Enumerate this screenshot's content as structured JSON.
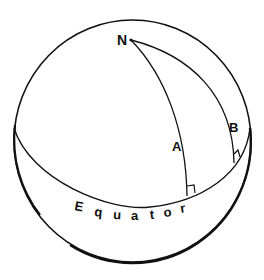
{
  "diagram": {
    "type": "sphere-geodesic",
    "labels": {
      "pole": "N",
      "meridian_a": "A",
      "meridian_b": "B",
      "equator_letters": [
        "E",
        "q",
        "u",
        "a",
        "t",
        "o",
        "r"
      ]
    },
    "colors": {
      "stroke": "#111111",
      "background": "#ffffff"
    },
    "elements": {
      "sphere": "circle outline",
      "equator": "ellipse (front arc)",
      "meridian_a": "great-circle arc from N to equator, right angle at equator",
      "meridian_b": "great-circle arc from N to equator, right angle at equator"
    }
  }
}
